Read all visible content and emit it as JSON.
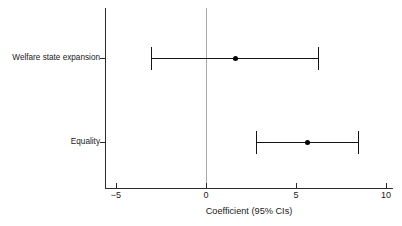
{
  "chart_data": {
    "type": "scatter",
    "title": "",
    "xlabel": "Coefficient (95% CIs)",
    "ylabel": "",
    "xlim": [
      -6.2,
      10.9
    ],
    "ylim": [
      0,
      2
    ],
    "grid": false,
    "legend": null,
    "reference_line": {
      "x": 0,
      "color": "#a8a8a8"
    },
    "xticks": [
      -5,
      0,
      5,
      10
    ],
    "xtick_labels": [
      "−5",
      "0",
      "5",
      "10"
    ],
    "categories": [
      "Welfare state expansion",
      "Equality"
    ],
    "series": [
      {
        "name": "Coefficient (95% CIs)",
        "marker": "circle",
        "color": "#000000",
        "points": [
          {
            "category": "Welfare state expansion",
            "estimate": 1.65,
            "ci_low": -3.05,
            "ci_high": 6.2,
            "significant": false
          },
          {
            "category": "Equality",
            "estimate": 5.65,
            "ci_low": 2.8,
            "ci_high": 8.45,
            "significant": true
          }
        ]
      }
    ]
  },
  "axis": {
    "x_title": "Coefficient (95% CIs)",
    "tick_labels": {
      "t0": "−5",
      "t1": "0",
      "t2": "5",
      "t3": "10"
    },
    "category_labels": {
      "c0": "Welfare state expansion",
      "c1": "Equality"
    }
  },
  "colors": {
    "axis": "#2b2b2b",
    "marker": "#000000",
    "interval": "#141414",
    "reference": "#a8a8a8",
    "background": "#ffffff"
  }
}
